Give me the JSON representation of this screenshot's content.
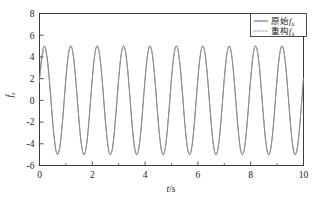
{
  "figure": {
    "background": "#ffffff",
    "frame_color": "#2b2b2b"
  },
  "axes": {
    "x": {
      "label": "t/s",
      "label_main": "t",
      "label_unit": "/s",
      "ticks": [
        "0",
        "2",
        "4",
        "6",
        "8",
        "10"
      ],
      "tick_values": [
        0,
        2,
        4,
        6,
        8,
        10
      ],
      "minor_tick_values": [
        1,
        3,
        5,
        7,
        9
      ],
      "range": [
        0,
        10
      ]
    },
    "y": {
      "label_main": "f",
      "label_sub": "s",
      "ticks": [
        "8",
        "6",
        "4",
        "2",
        "0",
        "-2",
        "-4",
        "-6"
      ],
      "tick_values": [
        8,
        6,
        4,
        2,
        0,
        -2,
        -4,
        -6
      ],
      "range": [
        -6,
        8
      ]
    }
  },
  "legend": {
    "position": "top-right",
    "entries": [
      {
        "label_cn": "原始",
        "label_var": "f",
        "label_sub": "s",
        "style": "solid",
        "color": "#4d4d4d"
      },
      {
        "label_cn": "重构",
        "label_var": "f",
        "label_sub": "s",
        "style": "dotted",
        "color": "#9a9a9a"
      }
    ]
  },
  "chart_data": {
    "type": "line",
    "title": "",
    "xlabel": "t/s",
    "ylabel": "f_s",
    "xlim": [
      0,
      10
    ],
    "ylim": [
      -6,
      8
    ],
    "grid": false,
    "legend_position": "upper right",
    "series": [
      {
        "name": "原始f_s",
        "style": "solid",
        "color": "#4d4d4d",
        "description": "Original signal: sine wave, amplitude 5, frequency 1 Hz, phase such that value is +2 rising at t=0, peaks near t=0.25,1.25,2.25,... troughs near t=0.75,1.75,2.75,...",
        "amplitude": 5,
        "frequency_hz": 1,
        "phase_rad": 0.41,
        "offset": 0,
        "x": [
          0,
          0.25,
          0.75,
          1.25,
          1.75,
          2.25,
          2.75,
          3.25,
          3.75,
          4.25,
          4.75,
          5.25,
          5.75,
          6.25,
          6.75,
          7.25,
          7.75,
          8.25,
          8.75,
          9.25,
          9.75,
          10
        ],
        "values": [
          2.0,
          5.0,
          -5.0,
          5.0,
          -5.0,
          5.0,
          -5.0,
          5.0,
          -5.0,
          5.0,
          -5.0,
          5.0,
          -5.0,
          5.0,
          -5.0,
          5.0,
          -5.0,
          5.0,
          -5.0,
          5.0,
          -5.0,
          0.6
        ]
      },
      {
        "name": "重构f_s",
        "style": "dotted",
        "color": "#9a9a9a",
        "description": "Reconstructed signal: overlays the original almost exactly; small visible deviation only in the first period (t approx 0 to 1)",
        "amplitude": 5,
        "frequency_hz": 1,
        "phase_rad": 0.41,
        "offset": 0,
        "x": [
          0,
          0.25,
          0.75,
          1.25,
          1.75,
          2.25,
          2.75,
          3.25,
          3.75,
          4.25,
          4.75,
          5.25,
          5.75,
          6.25,
          6.75,
          7.25,
          7.75,
          8.25,
          8.75,
          9.25,
          9.75,
          10
        ],
        "values": [
          1.6,
          4.8,
          -5.1,
          5.0,
          -5.0,
          5.0,
          -5.0,
          5.0,
          -5.0,
          5.0,
          -5.0,
          5.0,
          -5.0,
          5.0,
          -5.0,
          5.0,
          -5.0,
          5.0,
          -5.0,
          5.0,
          -5.0,
          0.6
        ]
      }
    ]
  }
}
